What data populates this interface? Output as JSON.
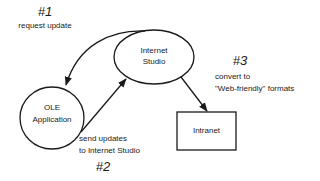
{
  "nodes": {
    "internet_studio": {
      "line1": "Internet",
      "line2": "Studio"
    },
    "ole_application": {
      "line1": "OLE",
      "line2": "Application"
    },
    "intranet": {
      "label": "Intranet"
    }
  },
  "steps": [
    {
      "number": "#1",
      "line1": "request update"
    },
    {
      "number": "#2",
      "line1": "send updates",
      "line2": "to Internet Studio"
    },
    {
      "number": "#3",
      "line1": "convert to",
      "line2": "\"Web-friendly\" formats"
    }
  ],
  "colors": {
    "stroke": "#1a1a1a",
    "background": "#ffffff"
  }
}
